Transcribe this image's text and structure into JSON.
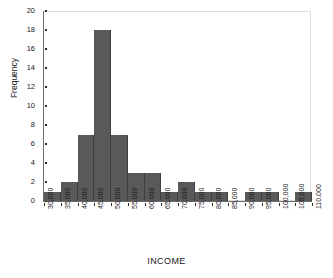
{
  "chart_data": {
    "type": "bar",
    "title": "",
    "subtitle": "",
    "xlabel": "INCOME",
    "ylabel": "Frequency",
    "grid": false,
    "legend": null,
    "legend_position": "none",
    "bar_color": "#595959",
    "axis_color": "#6e6e6e",
    "frame_color": "#dcdcdc",
    "background": "#ffffff",
    "xlim": [
      30000,
      110000
    ],
    "ylim": [
      0,
      20
    ],
    "bin_width": 5000,
    "xtick_labels": [
      "30,000",
      "35,000",
      "40,000",
      "45,000",
      "50,000",
      "55,000",
      "60,000",
      "65,000",
      "70,000",
      "75,000",
      "80,000",
      "85,000",
      "90,000",
      "95,000",
      "100,000",
      "105,000",
      "110,000"
    ],
    "xtick_values": [
      30000,
      35000,
      40000,
      45000,
      50000,
      55000,
      60000,
      65000,
      70000,
      75000,
      80000,
      85000,
      90000,
      95000,
      100000,
      105000,
      110000
    ],
    "ytick_labels": [
      "0",
      "2",
      "4",
      "6",
      "8",
      "10",
      "12",
      "14",
      "16",
      "18",
      "20"
    ],
    "ytick_values": [
      0,
      2,
      4,
      6,
      8,
      10,
      12,
      14,
      16,
      18,
      20
    ],
    "categories": [
      "30,000-35,000",
      "35,000-40,000",
      "40,000-45,000",
      "45,000-50,000",
      "50,000-55,000",
      "55,000-60,000",
      "60,000-65,000",
      "65,000-70,000",
      "70,000-75,000",
      "75,000-80,000",
      "80,000-85,000",
      "85,000-90,000",
      "90,000-95,000",
      "95,000-100,000",
      "100,000-105,000",
      "105,000-110,000"
    ],
    "bin_starts": [
      30000,
      35000,
      40000,
      45000,
      50000,
      55000,
      60000,
      65000,
      70000,
      75000,
      80000,
      85000,
      90000,
      95000,
      100000,
      105000
    ],
    "values": [
      1,
      2,
      7,
      18,
      7,
      3,
      3,
      1,
      2,
      1,
      1,
      0,
      1,
      1,
      0,
      1
    ]
  }
}
